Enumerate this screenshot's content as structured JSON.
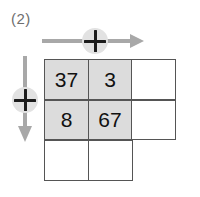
{
  "problem": {
    "label": "(2)"
  },
  "operators": {
    "top": {
      "symbol": "+",
      "direction": "right",
      "icon": "plus-in-circle-icon"
    },
    "left": {
      "symbol": "+",
      "direction": "down",
      "icon": "plus-in-circle-icon"
    }
  },
  "grid": {
    "rows": 3,
    "columns": 3,
    "cells": [
      [
        {
          "value": "37",
          "filled": true,
          "present": true
        },
        {
          "value": "3",
          "filled": true,
          "present": true
        },
        {
          "value": "",
          "filled": false,
          "present": true
        }
      ],
      [
        {
          "value": "8",
          "filled": true,
          "present": true
        },
        {
          "value": "67",
          "filled": true,
          "present": true
        },
        {
          "value": "",
          "filled": false,
          "present": true
        }
      ],
      [
        {
          "value": "",
          "filled": false,
          "present": true
        },
        {
          "value": "",
          "filled": false,
          "present": true
        },
        {
          "value": "",
          "filled": false,
          "present": false
        }
      ]
    ]
  },
  "colors": {
    "cell_border": "#555555",
    "cell_fill": "#dcdcdc",
    "arrow": "#a8a8a8",
    "badge_bg": "#e2e2e2",
    "label_text": "#6e6e6e",
    "number_text": "#111111"
  }
}
